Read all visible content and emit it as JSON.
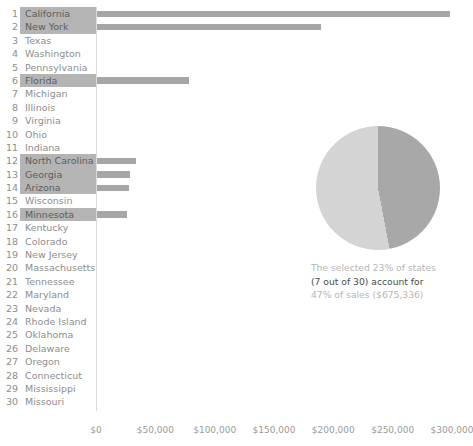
{
  "chart_data": {
    "type": "bar",
    "title": "",
    "xlabel": "",
    "ylabel": "",
    "grid": false,
    "legend": "none",
    "xlim": [
      0,
      300000
    ],
    "x_ticks": [
      "$0",
      "$50,000",
      "$100,000",
      "$150,000",
      "$200,000",
      "$250,000",
      "$300,000"
    ],
    "x_tick_values": [
      0,
      50000,
      100000,
      150000,
      200000,
      250000,
      300000
    ],
    "categories": [
      "California",
      "New York",
      "Texas",
      "Washington",
      "Pennsylvania",
      "Florida",
      "Michigan",
      "Illinois",
      "Virginia",
      "Ohio",
      "Indiana",
      "North Carolina",
      "Georgia",
      "Arizona",
      "Wisconsin",
      "Minnesota",
      "Kentucky",
      "Colorado",
      "New Jersey",
      "Massachusetts",
      "Tennessee",
      "Maryland",
      "Nevada",
      "Rhode Island",
      "Oklahoma",
      "Delaware",
      "Oregon",
      "Connecticut",
      "Mississippi",
      "Missouri"
    ],
    "values": [
      298000,
      190000,
      0,
      0,
      0,
      78000,
      0,
      0,
      0,
      0,
      0,
      34000,
      29000,
      28000,
      0,
      26000,
      0,
      0,
      0,
      0,
      0,
      0,
      0,
      0,
      0,
      0,
      0,
      0,
      0,
      0
    ],
    "selected": [
      "California",
      "New York",
      "Florida",
      "North Carolina",
      "Georgia",
      "Arizona",
      "Minnesota"
    ],
    "pie": {
      "type": "pie",
      "slices": [
        {
          "label": "selected share of sales",
          "value": 47
        },
        {
          "label": "remaining share of sales",
          "value": 53
        }
      ],
      "colors": [
        "#a8a8a8",
        "#d4d4d4"
      ]
    },
    "annotation": {
      "line1": "The selected 23% of states",
      "line2": "(7 out of 30) account for",
      "line3": "47% of sales ($675,336)"
    }
  },
  "rows": [
    {
      "rank": "1",
      "name": "California",
      "selected": true,
      "value": 298000
    },
    {
      "rank": "2",
      "name": "New York",
      "selected": true,
      "value": 190000
    },
    {
      "rank": "3",
      "name": "Texas",
      "selected": false,
      "value": 0
    },
    {
      "rank": "4",
      "name": "Washington",
      "selected": false,
      "value": 0
    },
    {
      "rank": "5",
      "name": "Pennsylvania",
      "selected": false,
      "value": 0
    },
    {
      "rank": "6",
      "name": "Florida",
      "selected": true,
      "value": 78000
    },
    {
      "rank": "7",
      "name": "Michigan",
      "selected": false,
      "value": 0
    },
    {
      "rank": "8",
      "name": "Illinois",
      "selected": false,
      "value": 0
    },
    {
      "rank": "9",
      "name": "Virginia",
      "selected": false,
      "value": 0
    },
    {
      "rank": "10",
      "name": "Ohio",
      "selected": false,
      "value": 0
    },
    {
      "rank": "11",
      "name": "Indiana",
      "selected": false,
      "value": 0
    },
    {
      "rank": "12",
      "name": "North Carolina",
      "selected": true,
      "value": 34000
    },
    {
      "rank": "13",
      "name": "Georgia",
      "selected": true,
      "value": 29000
    },
    {
      "rank": "14",
      "name": "Arizona",
      "selected": true,
      "value": 28000
    },
    {
      "rank": "15",
      "name": "Wisconsin",
      "selected": false,
      "value": 0
    },
    {
      "rank": "16",
      "name": "Minnesota",
      "selected": true,
      "value": 26000
    },
    {
      "rank": "17",
      "name": "Kentucky",
      "selected": false,
      "value": 0
    },
    {
      "rank": "18",
      "name": "Colorado",
      "selected": false,
      "value": 0
    },
    {
      "rank": "19",
      "name": "New Jersey",
      "selected": false,
      "value": 0
    },
    {
      "rank": "20",
      "name": "Massachusetts",
      "selected": false,
      "value": 0
    },
    {
      "rank": "21",
      "name": "Tennessee",
      "selected": false,
      "value": 0
    },
    {
      "rank": "22",
      "name": "Maryland",
      "selected": false,
      "value": 0
    },
    {
      "rank": "23",
      "name": "Nevada",
      "selected": false,
      "value": 0
    },
    {
      "rank": "24",
      "name": "Rhode Island",
      "selected": false,
      "value": 0
    },
    {
      "rank": "25",
      "name": "Oklahoma",
      "selected": false,
      "value": 0
    },
    {
      "rank": "26",
      "name": "Delaware",
      "selected": false,
      "value": 0
    },
    {
      "rank": "27",
      "name": "Oregon",
      "selected": false,
      "value": 0
    },
    {
      "rank": "28",
      "name": "Connecticut",
      "selected": false,
      "value": 0
    },
    {
      "rank": "29",
      "name": "Mississippi",
      "selected": false,
      "value": 0
    },
    {
      "rank": "30",
      "name": "Missouri",
      "selected": false,
      "value": 0
    }
  ],
  "colors": {
    "bar": "#b3b3b3",
    "bar_selected": "#a6a6a6",
    "highlight_bg": "#b4b4b4",
    "axis": "#dcdcdc",
    "text": "#8d8d8d",
    "note_muted": "#b6b6b6",
    "note_strong": "#4a4a4a",
    "pie_selected": "#a8a8a8",
    "pie_rest": "#d4d4d4"
  }
}
